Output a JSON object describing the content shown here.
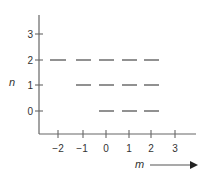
{
  "diagram": {
    "y_axis": {
      "label": "n",
      "ticks": [
        "3",
        "2",
        "1",
        "0"
      ]
    },
    "x_axis": {
      "label": "m",
      "ticks": [
        "−2",
        "−1",
        "0",
        "1",
        "2",
        "3"
      ]
    },
    "levels": [
      {
        "n": 2,
        "m_values": [
          -2,
          -1,
          0,
          1,
          2
        ]
      },
      {
        "n": 1,
        "m_values": [
          -1,
          0,
          1,
          2
        ]
      },
      {
        "n": 0,
        "m_values": [
          0,
          1,
          2
        ]
      }
    ],
    "line_color": "#666666",
    "dash_color": "#555555"
  }
}
